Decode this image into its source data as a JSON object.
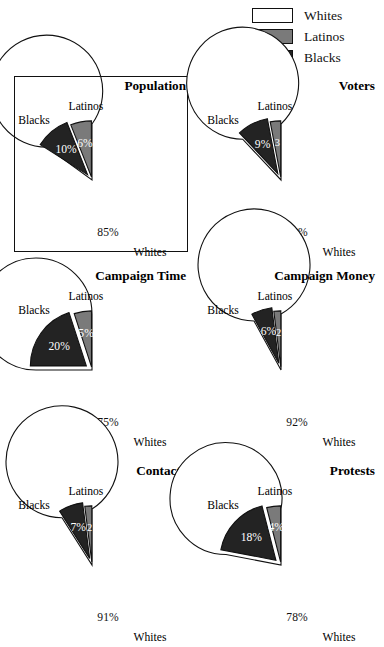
{
  "legend": {
    "items": [
      {
        "label": "Whites",
        "color": "#ffffff",
        "swatch_name": "legend-swatch-whites"
      },
      {
        "label": "Latinos",
        "color": "#7a7a7a",
        "swatch_name": "legend-swatch-latinos"
      },
      {
        "label": "Blacks",
        "color": "#232323",
        "swatch_name": "legend-swatch-blacks"
      }
    ]
  },
  "colors": {
    "whites": "#ffffff",
    "latinos": "#7a7a7a",
    "blacks": "#232323",
    "outline": "#111111"
  },
  "chart_data": [
    {
      "type": "pie",
      "title": "Population",
      "highlighted": true,
      "categories": [
        "Whites",
        "Latinos",
        "Blacks"
      ],
      "values": [
        85,
        6,
        10
      ],
      "value_labels": [
        "85%",
        "6%",
        "10%"
      ],
      "group_labels": {
        "blacks": "Blacks",
        "latinos": "Latinos",
        "whites": "Whites"
      }
    },
    {
      "type": "pie",
      "title": "Voters",
      "highlighted": false,
      "categories": [
        "Whites",
        "Latinos",
        "Blacks"
      ],
      "values": [
        88,
        3,
        9
      ],
      "value_labels": [
        "88%",
        "3",
        "9%"
      ],
      "group_labels": {
        "blacks": "Blacks",
        "latinos": "Latinos",
        "whites": "Whites"
      }
    },
    {
      "type": "pie",
      "title": "Campaign Time",
      "highlighted": false,
      "categories": [
        "Whites",
        "Latinos",
        "Blacks"
      ],
      "values": [
        75,
        5,
        20
      ],
      "value_labels": [
        "75%",
        "5%",
        "20%"
      ],
      "group_labels": {
        "blacks": "Blacks",
        "latinos": "Latinos",
        "whites": "Whites"
      }
    },
    {
      "type": "pie",
      "title": "Campaign Money",
      "highlighted": false,
      "categories": [
        "Whites",
        "Latinos",
        "Blacks"
      ],
      "values": [
        92,
        2,
        6
      ],
      "value_labels": [
        "92%",
        "2",
        "6%"
      ],
      "group_labels": {
        "blacks": "Blacks",
        "latinos": "Latinos",
        "whites": "Whites"
      }
    },
    {
      "type": "pie",
      "title": "Contacts",
      "highlighted": false,
      "categories": [
        "Whites",
        "Latinos",
        "Blacks"
      ],
      "values": [
        91,
        2,
        7
      ],
      "value_labels": [
        "91%",
        "2",
        "7%"
      ],
      "group_labels": {
        "blacks": "Blacks",
        "latinos": "Latinos",
        "whites": "Whites"
      }
    },
    {
      "type": "pie",
      "title": "Protests",
      "highlighted": false,
      "categories": [
        "Whites",
        "Latinos",
        "Blacks"
      ],
      "values": [
        78,
        4,
        18
      ],
      "value_labels": [
        "78%",
        "4%",
        "18%"
      ],
      "group_labels": {
        "blacks": "Blacks",
        "latinos": "Latinos",
        "whites": "Whites"
      }
    }
  ]
}
